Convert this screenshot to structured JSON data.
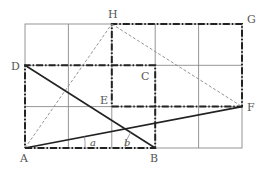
{
  "diagram": {
    "grid": {
      "cols": 5,
      "rows": 3,
      "x0": 25,
      "y0": 24,
      "cell_w": 43.4,
      "cell_h": 41.3,
      "color": "#8a8a8a"
    },
    "points": {
      "A": {
        "label": "A",
        "x": 25,
        "y": 148
      },
      "B": {
        "label": "B",
        "x": 156,
        "y": 148
      },
      "C": {
        "label": "C",
        "x": 156,
        "y": 106
      },
      "D": {
        "label": "D",
        "x": 25,
        "y": 65
      },
      "E": {
        "label": "E",
        "x": 112,
        "y": 106
      },
      "F": {
        "label": "F",
        "x": 242,
        "y": 106
      },
      "G": {
        "label": "G",
        "x": 242,
        "y": 24
      },
      "H": {
        "label": "H",
        "x": 112,
        "y": 24
      }
    },
    "angles": {
      "a": "a",
      "b": "b"
    },
    "colors": {
      "line": "#222222",
      "dashed": "#888888",
      "label": "#555555"
    }
  }
}
